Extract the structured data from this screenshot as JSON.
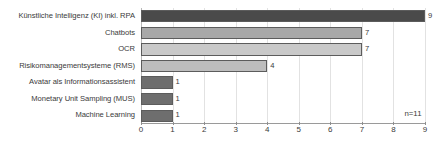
{
  "chart_data": {
    "type": "bar",
    "orientation": "horizontal",
    "title": "",
    "subtitle": "",
    "xlabel": "",
    "ylabel": "",
    "categories": [
      "Künstliche Intelligenz (KI) inkl. RPA",
      "Chatbots",
      "OCR",
      "Risikomanagementsysteme (RMS)",
      "Avatar als Informationsassistent",
      "Monetary Unit Sampling (MUS)",
      "Machine Learning"
    ],
    "values": [
      9,
      7,
      7,
      4,
      1,
      1,
      1
    ],
    "value_labels": [
      "9",
      "7",
      "7",
      "4",
      "1",
      "1",
      "1"
    ],
    "bar_colors": [
      "#4a4a4a",
      "#a8a8a8",
      "#c9c9c9",
      "#bdbdbd",
      "#6e6e6e",
      "#6e6e6e",
      "#6e6e6e"
    ],
    "bar_border_color": "#5c5c5c",
    "xlim": [
      0,
      9
    ],
    "xticks": [
      0,
      1,
      2,
      3,
      4,
      5,
      6,
      7,
      8,
      9
    ],
    "xtick_labels": [
      "0",
      "1",
      "2",
      "3",
      "4",
      "5",
      "6",
      "7",
      "8",
      "9"
    ],
    "grid": true,
    "grid_axis": "x",
    "legend": false,
    "annotations": [
      {
        "text": "n=11",
        "x": 8.35,
        "y": 6
      }
    ]
  }
}
